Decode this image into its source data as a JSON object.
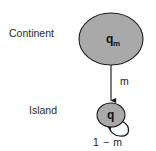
{
  "figure": {
    "background_color": "#ffffff",
    "width": 156,
    "height": 151
  },
  "labels": {
    "continent_row": "Continent",
    "island_row": "Island"
  },
  "nodes": [
    {
      "id": "continent",
      "shape": "ellipse",
      "label_main": "q",
      "label_sub": "m",
      "fill_color": "#a9a9a9",
      "stroke_color": "#1a1a1a",
      "cx": 111,
      "cy": 39,
      "rx": 32,
      "ry": 26
    },
    {
      "id": "island",
      "shape": "circle",
      "label_main": "q",
      "label_sub": "",
      "fill_color": "#a9a9a9",
      "stroke_color": "#1a1a1a",
      "cx": 111,
      "cy": 115,
      "rx": 14,
      "ry": 12
    }
  ],
  "edges": [
    {
      "id": "migration",
      "from": "continent",
      "to": "island",
      "label": "m",
      "type": "straight-arrow"
    },
    {
      "id": "self-loop",
      "from": "island",
      "to": "island",
      "label": "1 − m",
      "type": "self-loop-arrow"
    }
  ]
}
